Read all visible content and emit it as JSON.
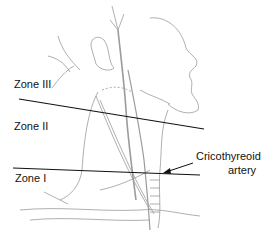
{
  "figure": {
    "labels": {
      "zone3": "Zone III",
      "zone2": "Zone II",
      "zone1": "Zone I",
      "annotation_line1": "Cricothyreoid",
      "annotation_line2": "artery"
    },
    "colors": {
      "ink": "#111111",
      "sketch": "#8a8a8a",
      "background": "#ffffff"
    }
  }
}
